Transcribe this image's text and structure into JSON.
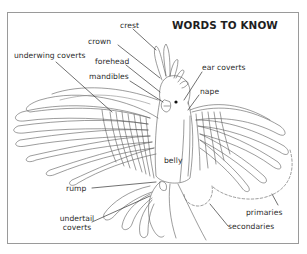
{
  "diagram": {
    "title": "WORDS TO KNOW",
    "labels": {
      "crest": "crest",
      "crown": "crown",
      "underwing_coverts": "underwing coverts",
      "forehead": "forehead",
      "mandibles": "mandibles",
      "ear_coverts": "ear coverts",
      "nape": "nape",
      "belly": "belly",
      "rump": "rump",
      "undertail_coverts_line1": "undertail",
      "undertail_coverts_line2": "coverts",
      "primaries": "primaries",
      "secondaries": "secondaries"
    },
    "colors": {
      "line": "#555555",
      "text": "#2b2b2b",
      "border": "#9a9a9a",
      "background": "#ffffff"
    }
  }
}
